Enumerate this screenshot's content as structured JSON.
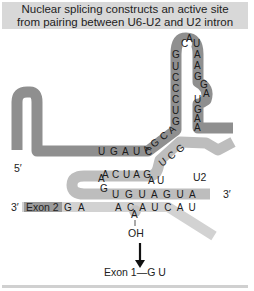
{
  "title": {
    "line1": "Nuclear splicing constructs an active site",
    "line2": "from pairing between U6-U2 and U2 intron"
  },
  "colors": {
    "title_band": "#d8d8d8",
    "u6_strand": "#8f8f8f",
    "u2_strand": "#c4c4c4",
    "intron_strand": "#d0d0d0",
    "exon2_box": "#9a9a9a",
    "text": "#1a1a1a"
  },
  "labels": {
    "five_prime": "5′",
    "three_prime_u2": "3′",
    "three_prime_exon": "3′",
    "u2": "U2",
    "exon2": "Exon 2",
    "oh": "OH",
    "product": "Exon 1—G  U"
  },
  "sequences": {
    "hairpin_loop": [
      "C",
      "A",
      "U"
    ],
    "hairpin_left_stem": [
      "G",
      "U",
      "C",
      "C",
      "C",
      "U",
      "G"
    ],
    "hairpin_right_stem": [
      "A",
      "A",
      "G",
      "G",
      "A",
      "U",
      "G",
      "A",
      "A",
      "C"
    ],
    "u6_horizontal": "U G A U C",
    "u6_diagonal": "A G C A",
    "u2_diagonal": "U C G",
    "u2_top_row": "A C U A G",
    "u2_au": "A U",
    "u2_left_g": "G",
    "u2_left_a": "A",
    "u2_bottom_row": "U G U A G U A",
    "exon2_tail": "G A",
    "intron_row": "A C  A U C A U",
    "branch_a": "A"
  }
}
